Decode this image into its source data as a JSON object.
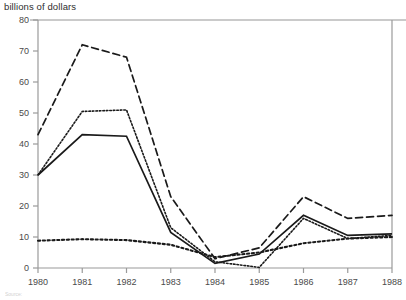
{
  "chart": {
    "axis_title": "billions of dollars",
    "source_note": "Source:"
  },
  "chart_data": {
    "type": "line",
    "title": "",
    "subtitle": "",
    "xlabel": "",
    "ylabel": "billions of dollars",
    "x": [
      1980,
      1981,
      1982,
      1983,
      1984,
      1985,
      1986,
      1987,
      1988
    ],
    "xtick_labels": [
      "1980",
      "1981",
      "1982",
      "1983",
      "1984",
      "1985",
      "1986",
      "1987",
      "1988"
    ],
    "ytick_labels": [
      "0",
      "10",
      "20",
      "30",
      "40",
      "50",
      "60",
      "70",
      "80"
    ],
    "yticks": [
      0,
      10,
      20,
      30,
      40,
      50,
      60,
      70,
      80
    ],
    "xlim": [
      1980,
      1988
    ],
    "ylim": [
      0,
      80
    ],
    "grid": false,
    "legend": "none",
    "legend_position": "none",
    "annotations": [],
    "series": [
      {
        "name": "dashed-series",
        "style": "dashed",
        "color": "#1a1a1a",
        "values": [
          43,
          72,
          68,
          23,
          3,
          6.5,
          23,
          16,
          17
        ]
      },
      {
        "name": "solid-series",
        "style": "solid",
        "color": "#1a1a1a",
        "values": [
          30,
          43,
          42.5,
          11.5,
          1.5,
          4.5,
          17,
          10.5,
          11
        ]
      },
      {
        "name": "fine-dotted-series",
        "style": "fine-dotted",
        "color": "#1a1a1a",
        "values": [
          30,
          50.5,
          51,
          13,
          2,
          0.2,
          16,
          9.5,
          10.5
        ]
      },
      {
        "name": "coarse-dotted-series",
        "style": "coarse-dotted",
        "color": "#1a1a1a",
        "values": [
          8.8,
          9.3,
          9,
          7.5,
          3.5,
          5,
          8,
          9.5,
          10
        ]
      }
    ]
  }
}
